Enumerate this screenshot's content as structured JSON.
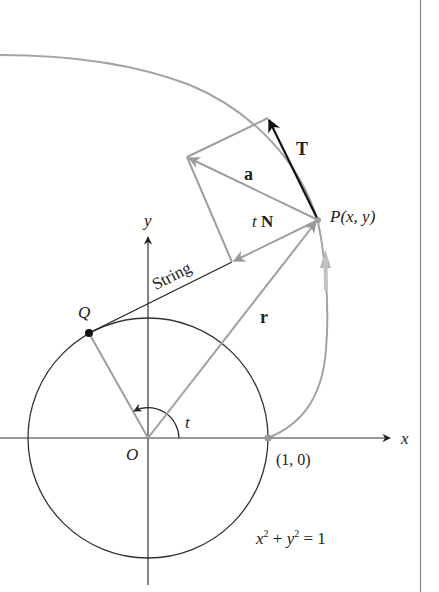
{
  "figure": {
    "colors": {
      "background": "#ffffff",
      "axis": "#333333",
      "circle": "#333333",
      "curve": "#a0a0a0",
      "vector_gray": "#9e9e9e",
      "tangent_vector": "#111111",
      "string": "#222222",
      "border": "#888888"
    },
    "labels": {
      "x_axis": "x",
      "y_axis": "y",
      "origin": "O",
      "point_q": "Q",
      "point_p": "P(x, y)",
      "point_start": "(1, 0)",
      "angle": "t",
      "string": "String",
      "vec_r": "r",
      "vec_T": "T",
      "vec_a": "a",
      "vec_tN_t": "t",
      "vec_tN_N": "N",
      "eq_x": "x",
      "eq_sup1": "2",
      "eq_plus": " + ",
      "eq_y": "y",
      "eq_sup2": "2",
      "eq_rest": " = 1"
    },
    "equation": "x^2 + y^2 = 1"
  }
}
